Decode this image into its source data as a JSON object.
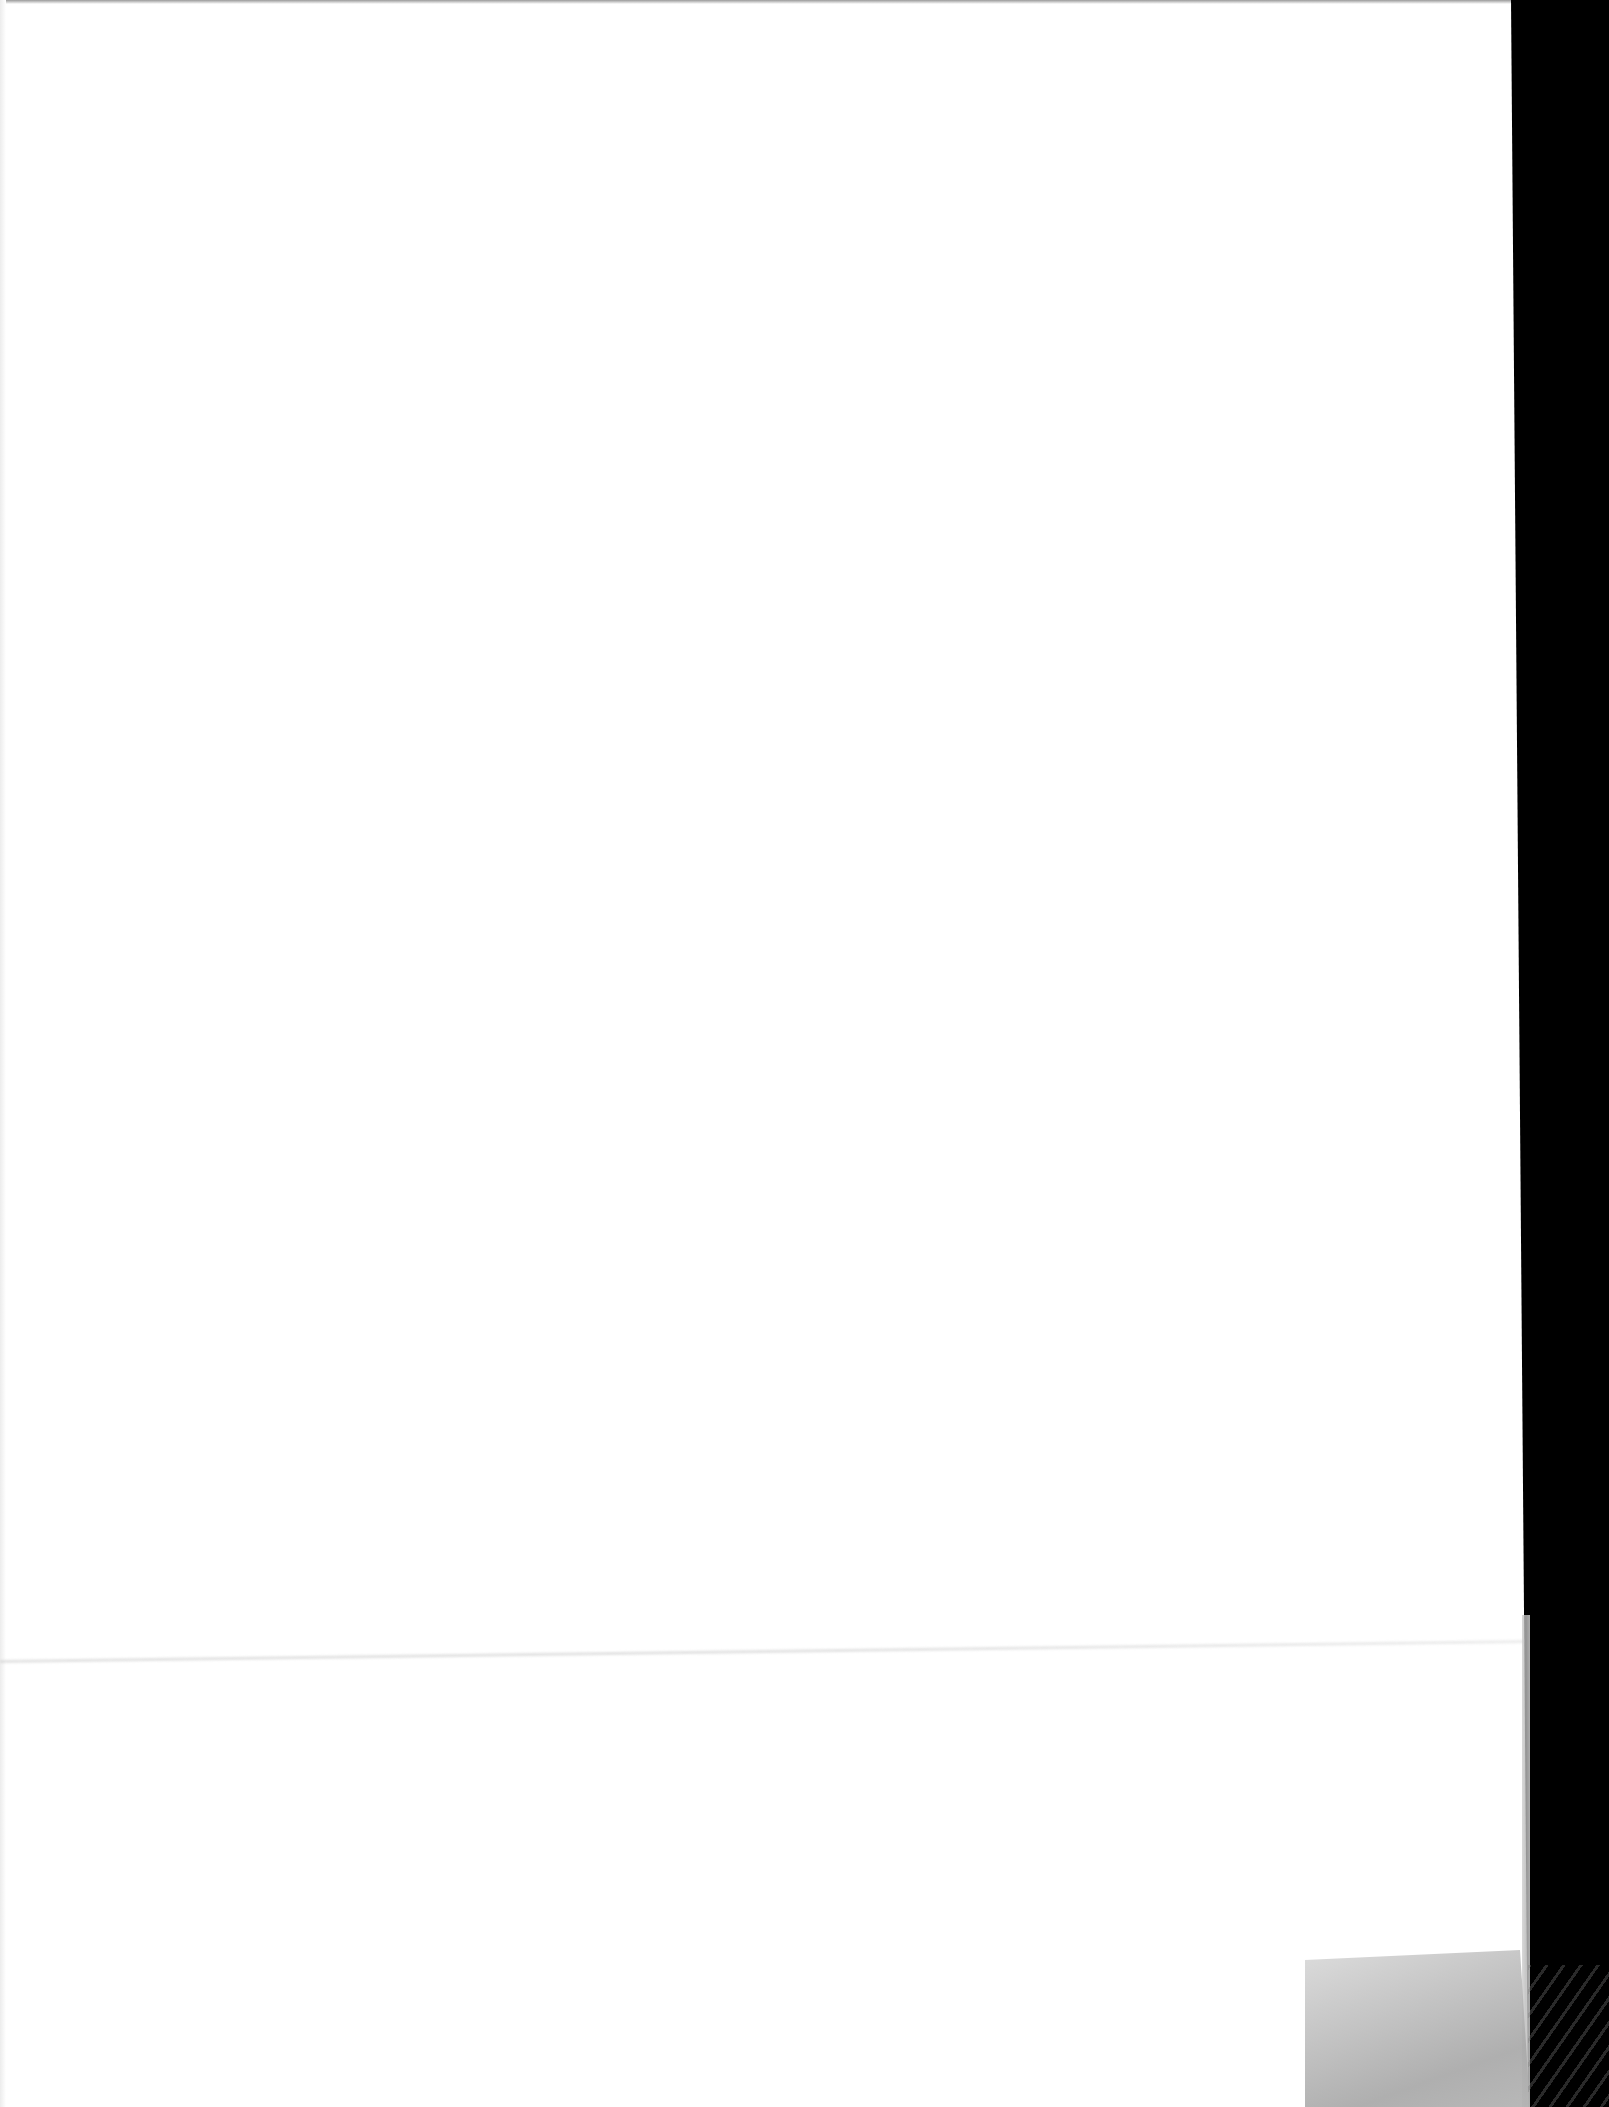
{
  "document": {
    "type": "scanned-blank-page",
    "text_content": "",
    "colors": {
      "paper": "#ffffff",
      "scanner_background": "#000000",
      "tape": "#b4b4b4",
      "crease": "#d4d4d4"
    },
    "features": {
      "crease": "faint horizontal fold line",
      "tape": "translucent tape piece at bottom-right corner",
      "edge": "dark scanner background on right side"
    }
  }
}
